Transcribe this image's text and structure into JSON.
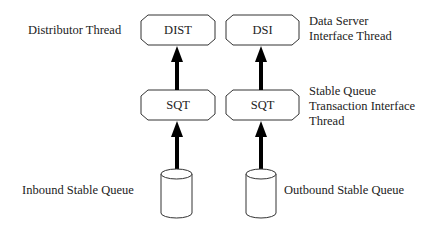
{
  "diagram": {
    "nodes": {
      "dist": {
        "label": "DIST"
      },
      "dsi": {
        "label": "DSI"
      },
      "sqt_left": {
        "label": "SQT"
      },
      "sqt_right": {
        "label": "SQT"
      },
      "inbound_queue": {
        "label": ""
      },
      "outbound_queue": {
        "label": ""
      }
    },
    "annotations": {
      "distributor": "Distributor Thread",
      "dsi_line1": "Data Server",
      "dsi_line2": "Interface Thread",
      "sqt_line1": "Stable Queue",
      "sqt_line2": "Transaction Interface",
      "sqt_line3": "Thread",
      "inbound": "Inbound Stable Queue",
      "outbound": "Outbound Stable Queue"
    },
    "edges": [
      {
        "from": "inbound_queue",
        "to": "sqt_left"
      },
      {
        "from": "sqt_left",
        "to": "dist"
      },
      {
        "from": "outbound_queue",
        "to": "sqt_right"
      },
      {
        "from": "sqt_right",
        "to": "dsi"
      }
    ]
  }
}
